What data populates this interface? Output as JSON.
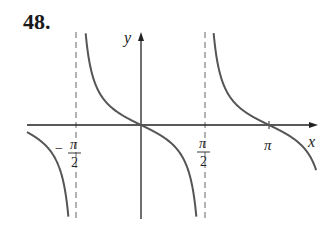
{
  "problem_number": "48.",
  "chart_data": {
    "type": "line",
    "title": "",
    "function": "y = -tan(x)",
    "xlabel": "x",
    "ylabel": "y",
    "x_ticks": [
      {
        "value": -1.5708,
        "label_num": "π",
        "label_den": "2",
        "label_sign": "−"
      },
      {
        "value": 1.5708,
        "label_num": "π",
        "label_den": "2",
        "label_sign": ""
      },
      {
        "value": 3.1416,
        "label": "π"
      }
    ],
    "asymptotes": [
      -1.5708,
      1.5708
    ],
    "asymptote_style": "dashed",
    "xlim": [
      -2.8,
      4.3
    ],
    "ylim": [
      -4.7,
      4.7
    ],
    "grid": false,
    "legend": null,
    "curve_color": "#555555",
    "axis_color": "#222222"
  }
}
